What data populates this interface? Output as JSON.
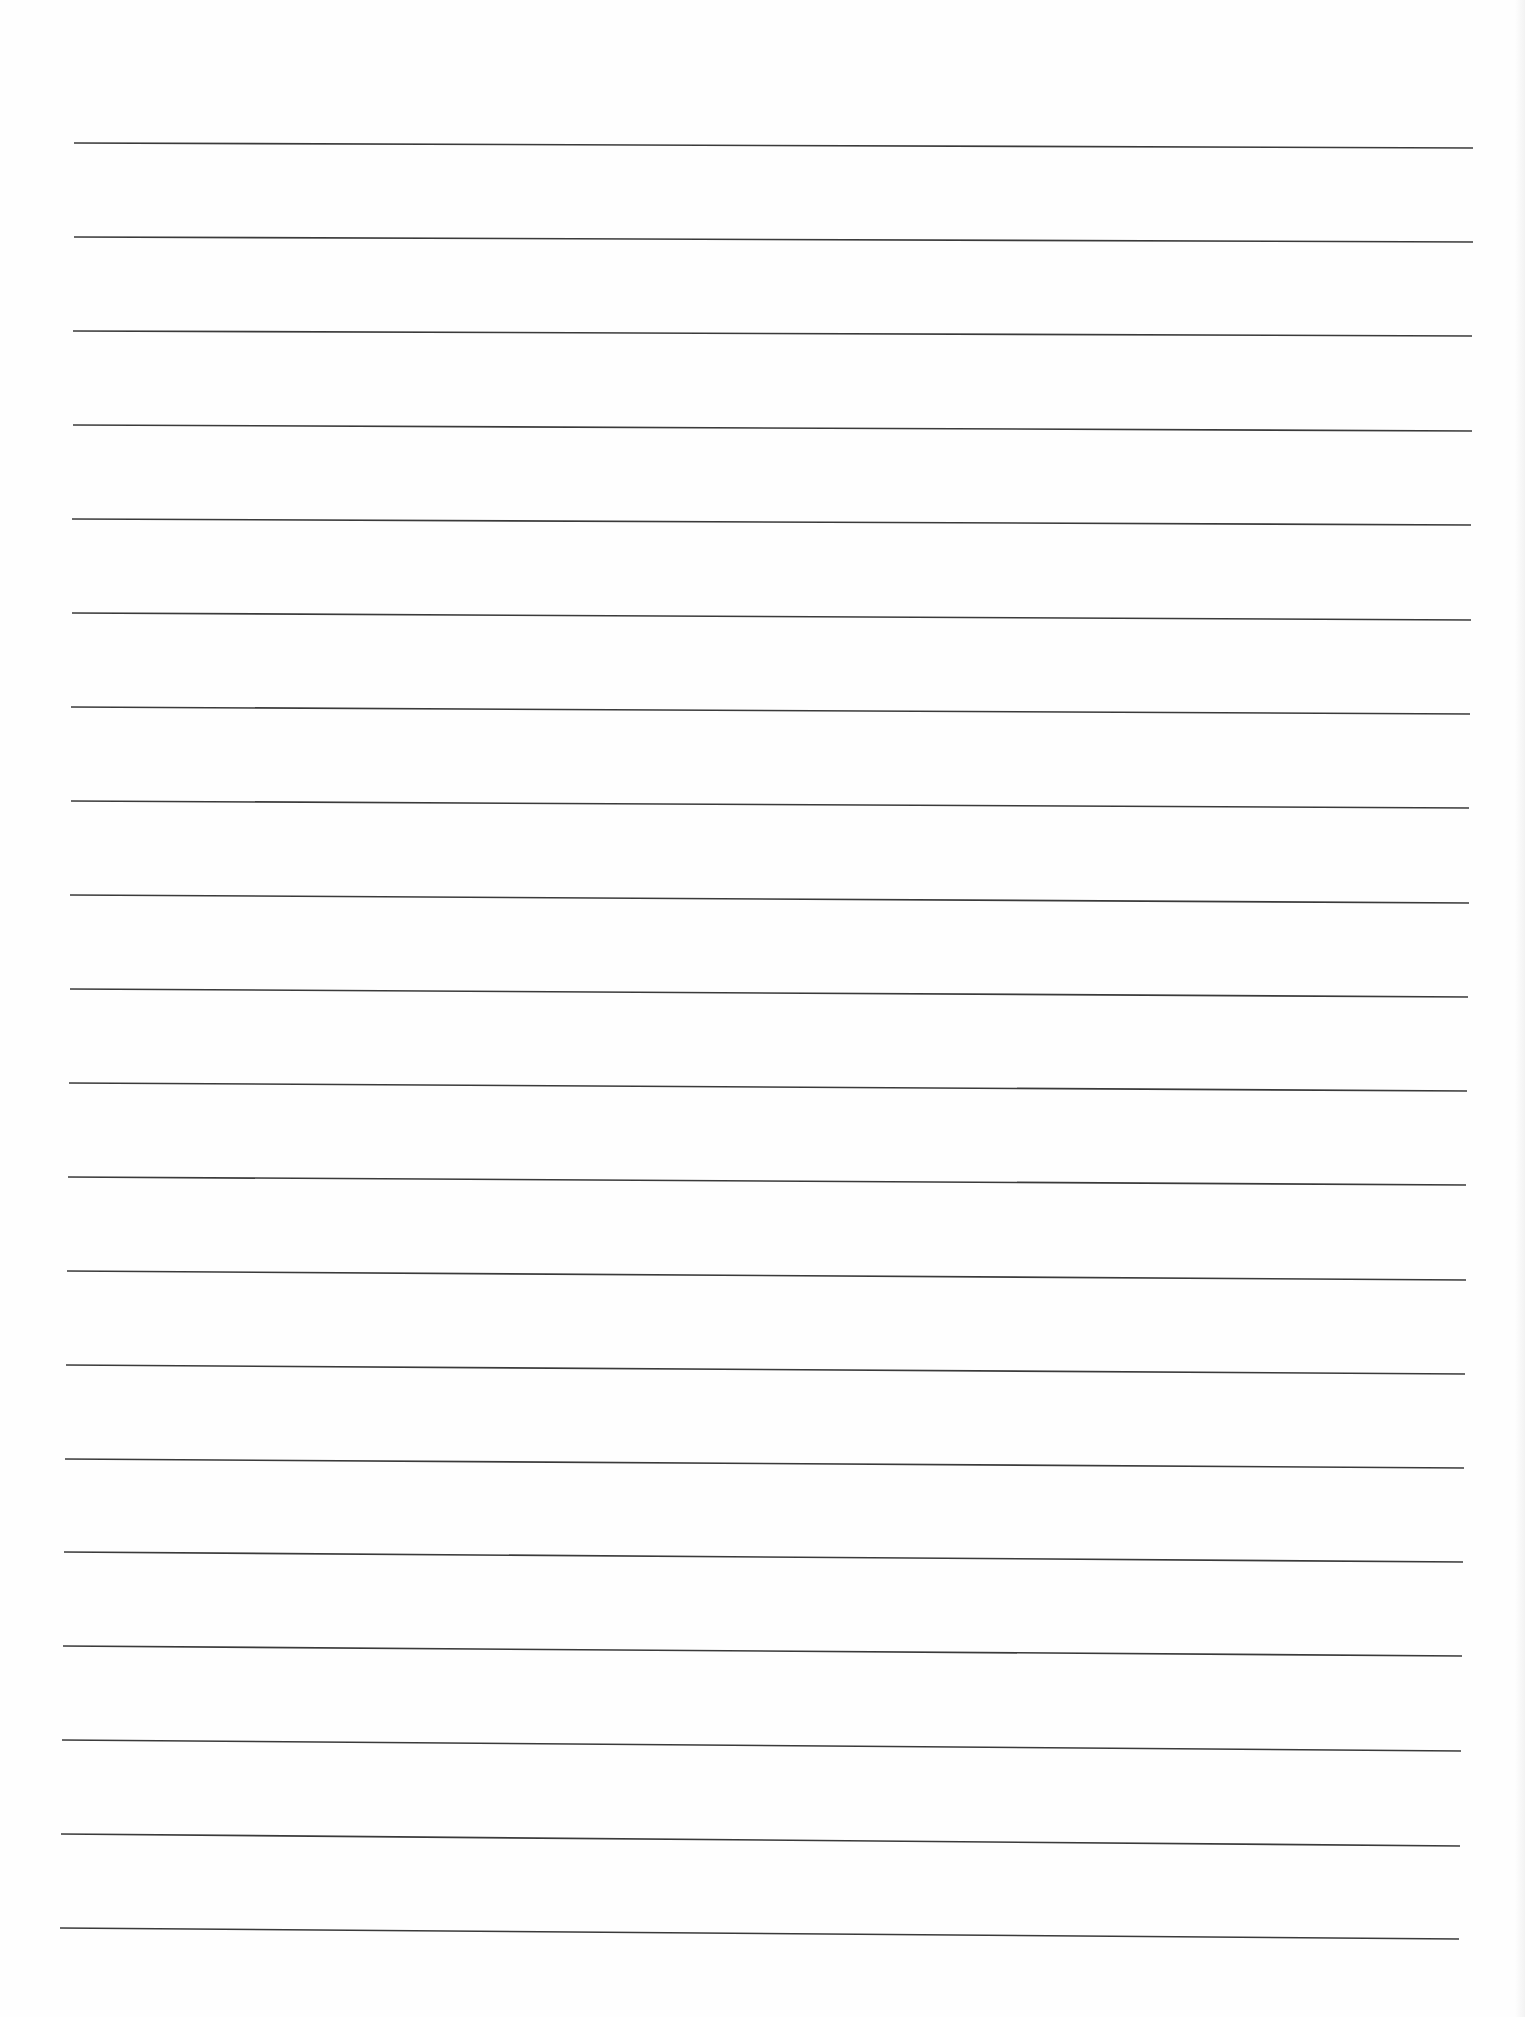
{
  "document": {
    "type": "lined-paper",
    "background_color": "#fefefe",
    "line_color": "#3a3a3a",
    "line_count": 20,
    "lines": [
      {
        "x1": 74,
        "y1": 143,
        "x2": 1473,
        "y2": 148
      },
      {
        "x1": 74,
        "y1": 237,
        "x2": 1473,
        "y2": 242
      },
      {
        "x1": 73,
        "y1": 331,
        "x2": 1472,
        "y2": 336
      },
      {
        "x1": 73,
        "y1": 425,
        "x2": 1472,
        "y2": 431
      },
      {
        "x1": 72,
        "y1": 519,
        "x2": 1471,
        "y2": 525
      },
      {
        "x1": 72,
        "y1": 613,
        "x2": 1471,
        "y2": 620
      },
      {
        "x1": 71,
        "y1": 707,
        "x2": 1470,
        "y2": 714
      },
      {
        "x1": 71,
        "y1": 801,
        "x2": 1469,
        "y2": 808
      },
      {
        "x1": 70,
        "y1": 895,
        "x2": 1469,
        "y2": 903
      },
      {
        "x1": 70,
        "y1": 989,
        "x2": 1468,
        "y2": 997
      },
      {
        "x1": 69,
        "y1": 1083,
        "x2": 1467,
        "y2": 1091
      },
      {
        "x1": 68,
        "y1": 1177,
        "x2": 1466,
        "y2": 1185
      },
      {
        "x1": 67,
        "y1": 1271,
        "x2": 1466,
        "y2": 1280
      },
      {
        "x1": 66,
        "y1": 1365,
        "x2": 1465,
        "y2": 1374
      },
      {
        "x1": 65,
        "y1": 1459,
        "x2": 1464,
        "y2": 1468
      },
      {
        "x1": 64,
        "y1": 1552,
        "x2": 1463,
        "y2": 1562
      },
      {
        "x1": 63,
        "y1": 1646,
        "x2": 1462,
        "y2": 1656
      },
      {
        "x1": 62,
        "y1": 1740,
        "x2": 1461,
        "y2": 1751
      },
      {
        "x1": 61,
        "y1": 1834,
        "x2": 1460,
        "y2": 1846
      },
      {
        "x1": 60,
        "y1": 1928,
        "x2": 1459,
        "y2": 1939
      }
    ]
  }
}
